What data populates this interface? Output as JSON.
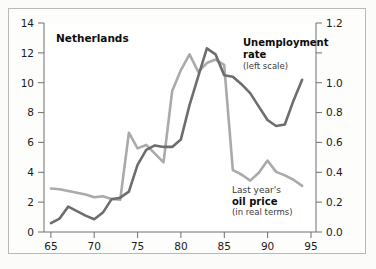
{
  "figure": {
    "background_color": "#fbfbfa",
    "frame_color": "#b9b9b9"
  },
  "chart_data": {
    "type": "line",
    "title": "Netherlands",
    "xlabel": "",
    "ylabel": "",
    "grid": false,
    "legend_position": "inline-annotation",
    "x": [
      65,
      66,
      67,
      68,
      69,
      70,
      71,
      72,
      73,
      74,
      75,
      76,
      77,
      78,
      79,
      80,
      81,
      82,
      83,
      84,
      85,
      86,
      87,
      88,
      89,
      90,
      91,
      92,
      93,
      94
    ],
    "xlim": [
      64.2,
      95.6
    ],
    "xticks": [
      65,
      70,
      75,
      80,
      85,
      90,
      95
    ],
    "xticklabels": [
      "65",
      "70",
      "75",
      "80",
      "85",
      "90",
      "95"
    ],
    "left_axis": {
      "label": "Unemployment rate",
      "ylim": [
        0,
        14
      ],
      "yticks": [
        0,
        2,
        4,
        6,
        8,
        10,
        12,
        14
      ],
      "yticklabels": [
        "0",
        "2",
        "4",
        "6",
        "8",
        "10",
        "12",
        "14"
      ]
    },
    "right_axis": {
      "label": "Last year's oil price (in real terms)",
      "ylim": [
        0.0,
        1.2
      ],
      "yticks": [
        0.0,
        0.2,
        0.4,
        0.6,
        0.8,
        1.0,
        1.2
      ],
      "yticklabels": [
        "0.0",
        "0.2",
        "0.4",
        "0.6",
        "0.8",
        "1.0",
        "1.2"
      ]
    },
    "series": [
      {
        "name": "Unemployment rate",
        "axis": "left",
        "color": "#6d6d6d",
        "linewidth": 2.6,
        "values": [
          0.6,
          0.9,
          1.7,
          1.4,
          1.1,
          0.85,
          1.3,
          2.2,
          2.3,
          2.7,
          4.5,
          5.5,
          5.8,
          5.7,
          5.7,
          6.2,
          8.5,
          10.4,
          12.3,
          11.9,
          10.5,
          10.4,
          9.9,
          9.3,
          8.4,
          7.5,
          7.1,
          7.2,
          8.8,
          10.2
        ]
      },
      {
        "name": "Last year's oil price (in real terms)",
        "axis": "right",
        "color": "#aaaaaa",
        "linewidth": 2.6,
        "values": [
          0.25,
          0.245,
          0.235,
          0.225,
          0.215,
          0.2,
          0.205,
          0.19,
          0.185,
          0.57,
          0.48,
          0.5,
          0.45,
          0.4,
          0.81,
          0.93,
          1.02,
          0.92,
          0.97,
          0.99,
          0.96,
          0.355,
          0.33,
          0.295,
          0.34,
          0.41,
          0.345,
          0.325,
          0.3,
          0.265
        ]
      }
    ],
    "annotations": [
      {
        "name": "unemployment-label",
        "lines": [
          "Unemployment",
          "rate",
          "(left scale)"
        ],
        "styles": [
          "bold",
          "bold",
          "regular"
        ],
        "x": 243,
        "y": 42
      },
      {
        "name": "oil-price-label",
        "lines": [
          "Last year's",
          "oil price",
          "(in real terms)"
        ],
        "styles": [
          "regular",
          "bold",
          "regular"
        ],
        "x": 232,
        "y": 190
      }
    ]
  },
  "labels": {
    "title": "Netherlands",
    "unemployment_line1": "Unemployment",
    "unemployment_line2": "rate",
    "unemployment_line3": "(left scale)",
    "oil_line1": "Last year's",
    "oil_line2": "oil price",
    "oil_line3": "(in real terms)"
  },
  "axis_text": {
    "x_0": "65",
    "x_1": "70",
    "x_2": "75",
    "x_3": "80",
    "x_4": "85",
    "x_5": "90",
    "x_6": "95",
    "l_0": "0",
    "l_1": "2",
    "l_2": "4",
    "l_3": "6",
    "l_4": "8",
    "l_5": "10",
    "l_6": "12",
    "l_7": "14",
    "r_0": "0.0",
    "r_1": "0.2",
    "r_2": "0.4",
    "r_3": "0.6",
    "r_4": "0.8",
    "r_5": "1.0",
    "r_6": "1.2"
  }
}
